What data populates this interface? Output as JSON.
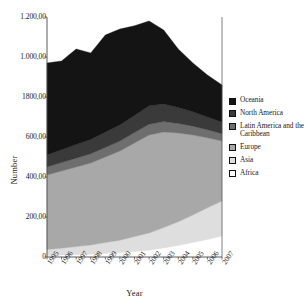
{
  "chart_data": {
    "type": "area",
    "stacked": true,
    "title": "",
    "xlabel": "Year",
    "ylabel": "Number",
    "x": [
      1995,
      1996,
      1997,
      1998,
      1999,
      2000,
      2001,
      2002,
      2003,
      2004,
      2005,
      2006,
      2007
    ],
    "xtick_labels": [
      "1995",
      "1996",
      "1997",
      "1998",
      "1999",
      "2000",
      "2001",
      "2002",
      "2003",
      "2004",
      "2005",
      "2006",
      "2007"
    ],
    "ytick_labels": [
      "0",
      "200,00",
      "400,00",
      "600,00",
      "1800,00",
      "1.000,00",
      "1.200,00"
    ],
    "ytick_values": [
      0,
      200,
      400,
      600,
      800,
      1000,
      1200
    ],
    "ylim": [
      0,
      1200
    ],
    "grid": false,
    "legend_position": "right",
    "series": [
      {
        "name": "Africa",
        "color": "#ffffff",
        "values": [
          8,
          10,
          12,
          14,
          18,
          22,
          28,
          34,
          45,
          58,
          72,
          88,
          105
        ]
      },
      {
        "name": "Asia",
        "color": "#dedede",
        "values": [
          30,
          34,
          40,
          46,
          54,
          62,
          74,
          86,
          102,
          118,
          138,
          158,
          175
        ]
      },
      {
        "name": "Europe",
        "color": "#a8a8a8",
        "values": [
          372,
          386,
          398,
          410,
          428,
          446,
          468,
          490,
          478,
          444,
          400,
          350,
          300
        ]
      },
      {
        "name": "Latin America and the Caribbean",
        "color": "#6e6e6e",
        "values": [
          40,
          42,
          44,
          46,
          48,
          50,
          52,
          54,
          52,
          48,
          44,
          40,
          36
        ]
      },
      {
        "name": "North America",
        "color": "#3a3a3a",
        "values": [
          60,
          64,
          68,
          72,
          76,
          80,
          86,
          92,
          88,
          80,
          72,
          64,
          58
        ]
      },
      {
        "name": "Oceania",
        "color": "#141414",
        "values": [
          460,
          444,
          478,
          432,
          486,
          480,
          448,
          424,
          370,
          292,
          244,
          210,
          186
        ]
      }
    ],
    "totals": [
      970,
      980,
      1040,
      1020,
      1110,
      1140,
      1156,
      1180,
      1135,
      1040,
      970,
      910,
      860
    ]
  },
  "legend": {
    "entries": [
      {
        "label": "Oceania",
        "color": "#141414"
      },
      {
        "label": "North America",
        "color": "#3a3a3a"
      },
      {
        "label": "Latin America and the Caribbean",
        "color": "#6e6e6e"
      },
      {
        "label": "Europe",
        "color": "#a8a8a8"
      },
      {
        "label": "Asia",
        "color": "#dedede"
      },
      {
        "label": "Africa",
        "color": "#ffffff"
      }
    ]
  }
}
